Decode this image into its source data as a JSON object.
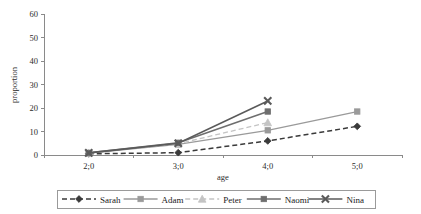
{
  "chart_data": {
    "type": "line",
    "title": "",
    "xlabel": "age",
    "ylabel": "proportion",
    "categories": [
      "2;0",
      "3;0",
      "4;0",
      "5;0"
    ],
    "ylim": [
      0,
      60
    ],
    "yticks": [
      0,
      10,
      20,
      30,
      40,
      50,
      60
    ],
    "grid": false,
    "legend_position": "bottom",
    "series": [
      {
        "name": "Sarah",
        "values": [
          0.5,
          1.0,
          6.0,
          12.2
        ],
        "color": "#3a3a3a",
        "marker": "diamond",
        "dash": "dashed"
      },
      {
        "name": "Adam",
        "values": [
          0.8,
          4.5,
          10.5,
          18.5
        ],
        "color": "#9a9a9a",
        "marker": "square",
        "dash": "solid"
      },
      {
        "name": "Peter",
        "values": [
          0.8,
          4.8,
          13.8,
          null
        ],
        "color": "#c4c4c4",
        "marker": "triangle",
        "dash": "dashed"
      },
      {
        "name": "Naomi",
        "values": [
          0.9,
          5.2,
          18.5,
          null
        ],
        "color": "#6e6e6e",
        "marker": "square",
        "dash": "solid"
      },
      {
        "name": "Nina",
        "values": [
          0.9,
          5.0,
          23.0,
          null
        ],
        "color": "#5a5a5a",
        "marker": "cross",
        "dash": "solid"
      }
    ]
  },
  "axes": {
    "y_tick_labels": [
      "0",
      "10",
      "20",
      "30",
      "40",
      "50",
      "60"
    ],
    "x_tick_labels": [
      "2;0",
      "3;0",
      "4;0",
      "5;0"
    ],
    "x_axis_title": "age",
    "y_axis_title": "proportion"
  },
  "legend": {
    "entries": [
      {
        "label": "Sarah"
      },
      {
        "label": "Adam"
      },
      {
        "label": "Peter"
      },
      {
        "label": "Naomi"
      },
      {
        "label": "Nina"
      }
    ]
  }
}
